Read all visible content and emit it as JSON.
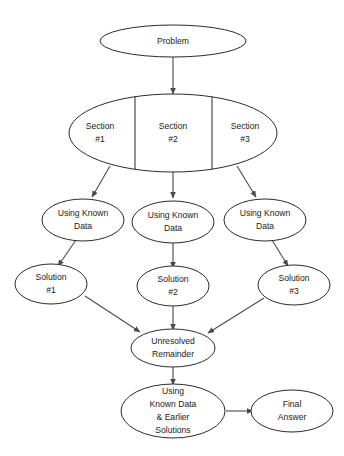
{
  "diagram": {
    "type": "flowchart",
    "background_color": "#ffffff",
    "node_fill_color": "#ffffff",
    "node_stroke_color": "#2b2b2b",
    "edge_color": "#4a4a4a",
    "text_color": "#1a1a1a"
  },
  "nodes": {
    "problem": {
      "label": "Problem"
    },
    "sections": {
      "section1_line1": "Section",
      "section1_line2": "#1",
      "section2_line1": "Section",
      "section2_line2": "#2",
      "section3_line1": "Section",
      "section3_line2": "#3"
    },
    "known_data_1": {
      "line1": "Using Known",
      "line2": "Data"
    },
    "known_data_2": {
      "line1": "Using Known",
      "line2": "Data"
    },
    "known_data_3": {
      "line1": "Using Known",
      "line2": "Data"
    },
    "solution_1": {
      "line1": "Solution",
      "line2": "#1"
    },
    "solution_2": {
      "line1": "Solution",
      "line2": "#2"
    },
    "solution_3": {
      "line1": "Solution",
      "line2": "#3"
    },
    "unresolved": {
      "line1": "Unresolved",
      "line2": "Remainder"
    },
    "final_method": {
      "line1": "Using",
      "line2": "Known Data",
      "line3": "& Earlier",
      "line4": "Solutions"
    },
    "final_answer": {
      "line1": "Final",
      "line2": "Answer"
    }
  }
}
